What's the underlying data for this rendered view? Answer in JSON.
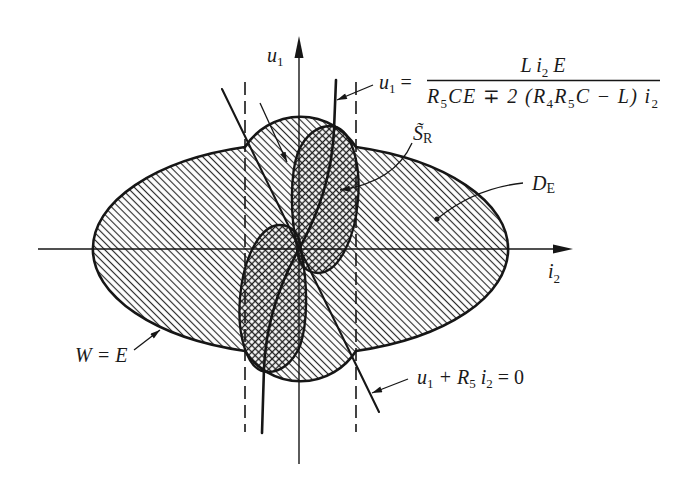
{
  "figure": {
    "colors": {
      "ink": "#161616",
      "background": "#ffffff"
    }
  },
  "axes": {
    "vertical": {
      "label": [
        "u",
        "1"
      ]
    },
    "horizontal": {
      "label": [
        "i",
        "2"
      ]
    }
  },
  "formula": {
    "lhs": [
      "u",
      "1",
      " ="
    ],
    "numerator": [
      "L i",
      "2",
      " E"
    ],
    "denominator": [
      "R",
      "5",
      "CE ∓ 2 (R",
      "4",
      "R",
      "5",
      "C − L) i",
      "2"
    ]
  },
  "labels": {
    "s_r": [
      "S̃",
      "R"
    ],
    "d_e": [
      "D",
      "E"
    ],
    "w_eq_e": "W = E",
    "line_eq": [
      "u",
      "1",
      " + R",
      "5",
      " i",
      "2",
      " = 0"
    ]
  }
}
